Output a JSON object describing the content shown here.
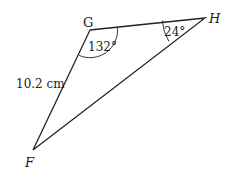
{
  "figure": {
    "type": "triangle",
    "vertices": {
      "G": {
        "label": "G",
        "x": 90,
        "y": 30
      },
      "H": {
        "label": "H",
        "x": 205,
        "y": 18
      },
      "F": {
        "label": "F",
        "x": 33,
        "y": 150
      }
    },
    "angles": {
      "G": {
        "value": "132°"
      },
      "H": {
        "value": "24°"
      }
    },
    "sides": {
      "FG": {
        "length": "10.2 cm"
      }
    },
    "colors": {
      "stroke": "#222222",
      "background": "#ffffff"
    }
  }
}
